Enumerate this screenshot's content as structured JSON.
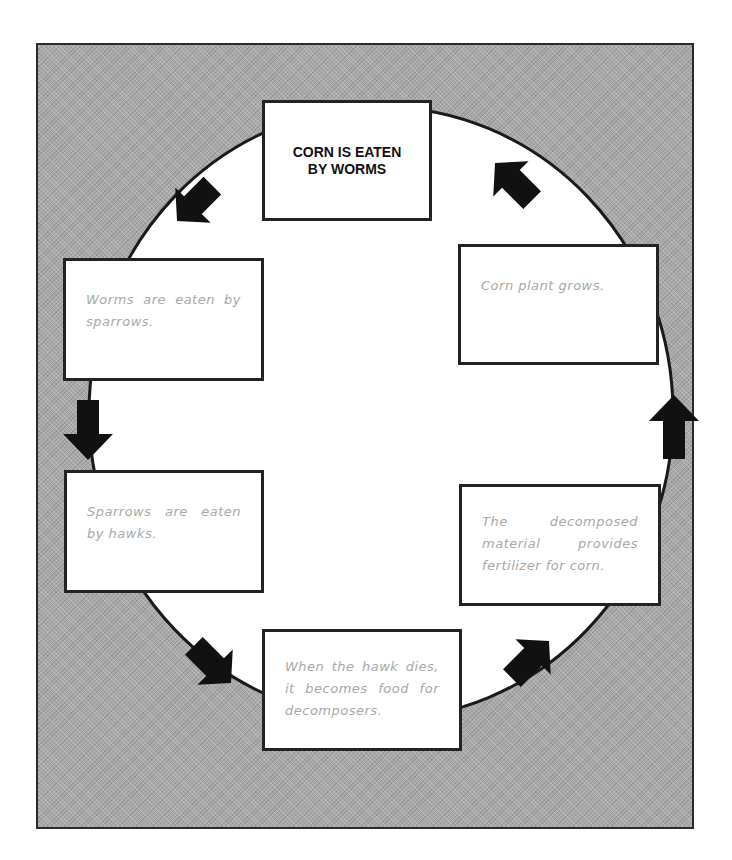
{
  "diagram": {
    "type": "cycle",
    "title_node": "CORN IS EATEN BY WORMS",
    "steps": [
      {
        "id": "corn-eaten",
        "text": "CORN IS EATEN BY WORMS"
      },
      {
        "id": "worms-eaten",
        "text": "Worms are eaten by sparrows."
      },
      {
        "id": "sparrows-eaten",
        "text": "Sparrows are eaten by hawks."
      },
      {
        "id": "hawk-dies",
        "text": "When the hawk dies, it becomes food for decomposers."
      },
      {
        "id": "fertilizer",
        "text": "The decomposed material provides fertilizer for corn."
      },
      {
        "id": "corn-grows",
        "text": "Corn plant grows."
      }
    ],
    "flow_direction": "counter-clockwise",
    "colors": {
      "background_pattern": "#a9a9a9",
      "box_fill": "#ffffff",
      "border": "#232323",
      "arrow": "#111111",
      "step_text": "#a8a8a8"
    }
  }
}
